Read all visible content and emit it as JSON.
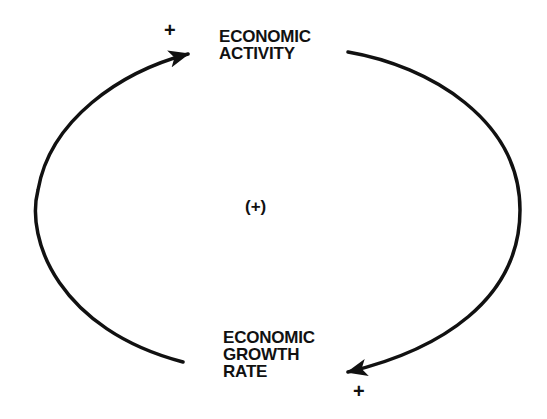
{
  "diagram": {
    "type": "causal-loop",
    "nodes": [
      {
        "id": "economic-activity",
        "lines": [
          "ECONOMIC",
          "ACTIVITY"
        ]
      },
      {
        "id": "economic-growth-rate",
        "lines": [
          "ECONOMIC",
          "GROWTH",
          "RATE"
        ]
      }
    ],
    "links": [
      {
        "from": "economic-growth-rate",
        "to": "economic-activity",
        "polarity": "+"
      },
      {
        "from": "economic-activity",
        "to": "economic-growth-rate",
        "polarity": "+"
      }
    ],
    "loop_polarity": "(+)",
    "colors": {
      "ink": "#111111",
      "background": "#ffffff"
    }
  }
}
